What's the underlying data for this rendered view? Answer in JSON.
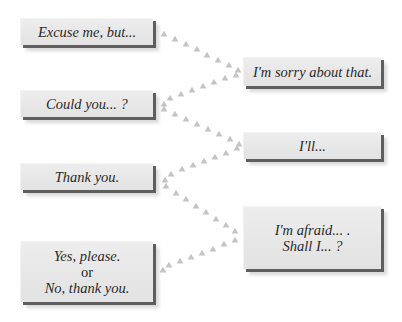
{
  "diagram": {
    "type": "phrase-response-matching",
    "arrow_color": "#c4c4c4",
    "box_face_color": "#e6e6e6",
    "box_edge_color": "#5e5e5e",
    "left_phrases": [
      {
        "id": "L1",
        "text": "Excuse me, but..."
      },
      {
        "id": "L2",
        "text": "Could you... ?"
      },
      {
        "id": "L3",
        "text": "Thank you."
      },
      {
        "id": "L4",
        "line1": "Yes, please.",
        "line2": "or",
        "line3": "No, thank you."
      }
    ],
    "right_phrases": [
      {
        "id": "R1",
        "text": "I'm sorry about that."
      },
      {
        "id": "R2",
        "text": "I'll..."
      },
      {
        "id": "R3",
        "line1": "I'm afraid... .",
        "line2": "Shall I... ?"
      }
    ],
    "connections": [
      {
        "from": "L1",
        "to": "R1",
        "direction": "to-right"
      },
      {
        "from": "R1",
        "to": "L2",
        "direction": "to-left"
      },
      {
        "from": "L2",
        "to": "R2",
        "direction": "to-right"
      },
      {
        "from": "R2",
        "to": "L3",
        "direction": "to-left"
      },
      {
        "from": "L3",
        "to": "R3",
        "direction": "to-right"
      },
      {
        "from": "R3",
        "to": "L4",
        "direction": "to-left"
      }
    ]
  }
}
